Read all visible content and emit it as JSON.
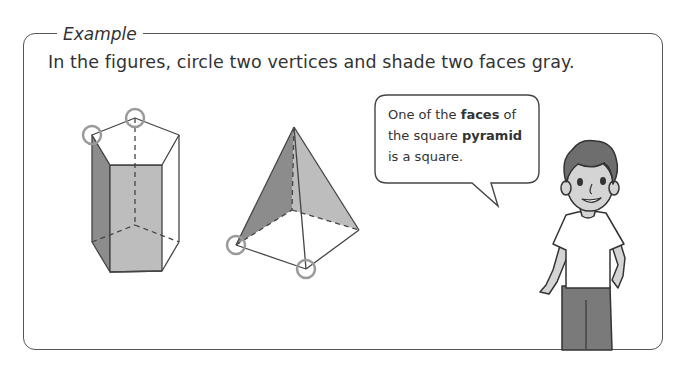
{
  "example": {
    "label": "Example",
    "instruction": "In the figures, circle two vertices and shade two faces gray."
  },
  "speech_bubble": {
    "line1_pre": "One of the ",
    "line1_bold": "faces",
    "line1_post": " of",
    "line2_pre": "the square ",
    "line2_bold": "pyramid",
    "line3": "is a square."
  },
  "figures": {
    "prism": "pentagonal-prism",
    "pyramid": "square-pyramid",
    "circled_vertices_per_figure": 2,
    "shaded_faces_per_figure": 2
  },
  "colors": {
    "frame": "#555555",
    "shade_dark": "#8c8c8c",
    "shade_light": "#bdbdbd",
    "circle": "#9a9a9a",
    "text": "#333333"
  }
}
